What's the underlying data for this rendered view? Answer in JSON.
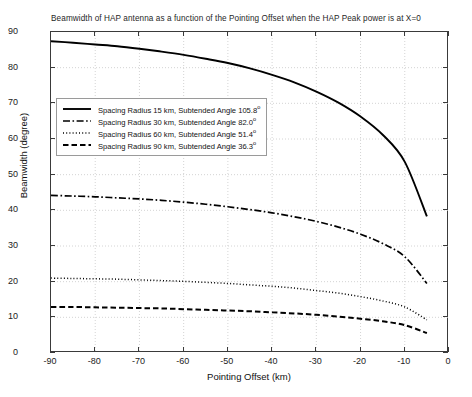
{
  "chart_data": {
    "type": "line",
    "title": "Beamwidth of HAP antenna as a function of the Pointing Offset when the HAP Peak power is at X=0",
    "xlabel": "Pointing Offset (km)",
    "ylabel": "Beamwidth (degree)",
    "xlim": [
      -90,
      0
    ],
    "ylim": [
      0,
      90
    ],
    "xticks": [
      -90,
      -80,
      -70,
      -60,
      -50,
      -40,
      -30,
      -20,
      -10,
      0
    ],
    "yticks": [
      0,
      10,
      20,
      30,
      40,
      50,
      60,
      70,
      80,
      90
    ],
    "grid": true,
    "legend_position": "upper left",
    "series": [
      {
        "name": "Spacing Radius 15 km, Subtended Angle 105.8°",
        "style": "solid",
        "x": [
          -90,
          -85,
          -80,
          -75,
          -70,
          -65,
          -60,
          -55,
          -50,
          -45,
          -40,
          -35,
          -30,
          -25,
          -20,
          -15,
          -10,
          -5
        ],
        "y": [
          87.4,
          87.0,
          86.5,
          86.0,
          85.3,
          84.5,
          83.6,
          82.5,
          81.3,
          79.8,
          78.0,
          75.9,
          73.3,
          70.2,
          66.3,
          61.2,
          53.6,
          38.3
        ]
      },
      {
        "name": "Spacing Radius 30 km, Subtended Angle 82.0°",
        "style": "dashdot",
        "x": [
          -90,
          -85,
          -80,
          -75,
          -70,
          -65,
          -60,
          -55,
          -50,
          -45,
          -40,
          -35,
          -30,
          -25,
          -20,
          -15,
          -10,
          -5
        ],
        "y": [
          44.2,
          44.0,
          43.8,
          43.5,
          43.2,
          42.8,
          42.3,
          41.7,
          41.0,
          40.2,
          39.3,
          38.2,
          36.9,
          35.3,
          33.3,
          30.7,
          27.0,
          19.5
        ]
      },
      {
        "name": "Spacing Radius 60 km, Subtended Angle 51.4°",
        "style": "dotted",
        "x": [
          -90,
          -85,
          -80,
          -75,
          -70,
          -65,
          -60,
          -55,
          -50,
          -45,
          -40,
          -35,
          -30,
          -25,
          -20,
          -15,
          -10,
          -5
        ],
        "y": [
          21.0,
          20.9,
          20.8,
          20.7,
          20.5,
          20.3,
          20.1,
          19.8,
          19.5,
          19.1,
          18.7,
          18.2,
          17.5,
          16.8,
          15.8,
          14.6,
          12.9,
          9.3
        ]
      },
      {
        "name": "Spacing Radius 90 km, Subtended Angle 36.3°",
        "style": "dashed",
        "x": [
          -90,
          -85,
          -80,
          -75,
          -70,
          -65,
          -60,
          -55,
          -50,
          -45,
          -40,
          -35,
          -30,
          -25,
          -20,
          -15,
          -10,
          -5
        ],
        "y": [
          12.9,
          12.9,
          12.8,
          12.7,
          12.6,
          12.5,
          12.3,
          12.1,
          11.9,
          11.7,
          11.4,
          11.1,
          10.7,
          10.2,
          9.6,
          8.9,
          7.8,
          5.6
        ]
      }
    ]
  },
  "legend": {
    "entries": [
      {
        "label_prefix": "Spacing Radius 15 km, Subtended Angle 105.8",
        "degree": "o"
      },
      {
        "label_prefix": "Spacing Radius 30 km, Subtended Angle 82.0",
        "degree": "o"
      },
      {
        "label_prefix": "Spacing Radius 60 km, Subtended Angle 51.4",
        "degree": "o"
      },
      {
        "label_prefix": "Spacing Radius 90 km, Subtended Angle 36.3",
        "degree": "o"
      }
    ]
  },
  "colors": {
    "line": "#000000",
    "grid": "#cfcfcf",
    "axis": "#3a3a3a",
    "background": "#ffffff"
  }
}
